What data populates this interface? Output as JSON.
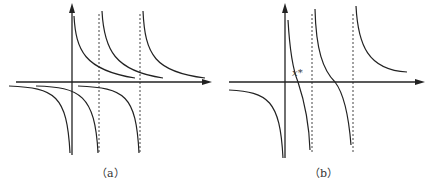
{
  "figure": {
    "panels": [
      {
        "id": "a",
        "caption": "（a）",
        "description": "Graphs of two families of hyperbola-like branches with vertical asymptotes at the y-axis and two dashed lines; positive branches decay to the x-axis from above, negative branches come from below."
      },
      {
        "id": "b",
        "caption": "（b）",
        "description": "Combined function with vertical asymptotes at the y-axis and two dashed lines; decreasing branches crossing the x-axis, first root labeled x*."
      }
    ],
    "root_label": "x*",
    "colors": {
      "curve": "#222222",
      "axis": "#222222",
      "asymptote": "#444444",
      "background": "#ffffff"
    }
  }
}
